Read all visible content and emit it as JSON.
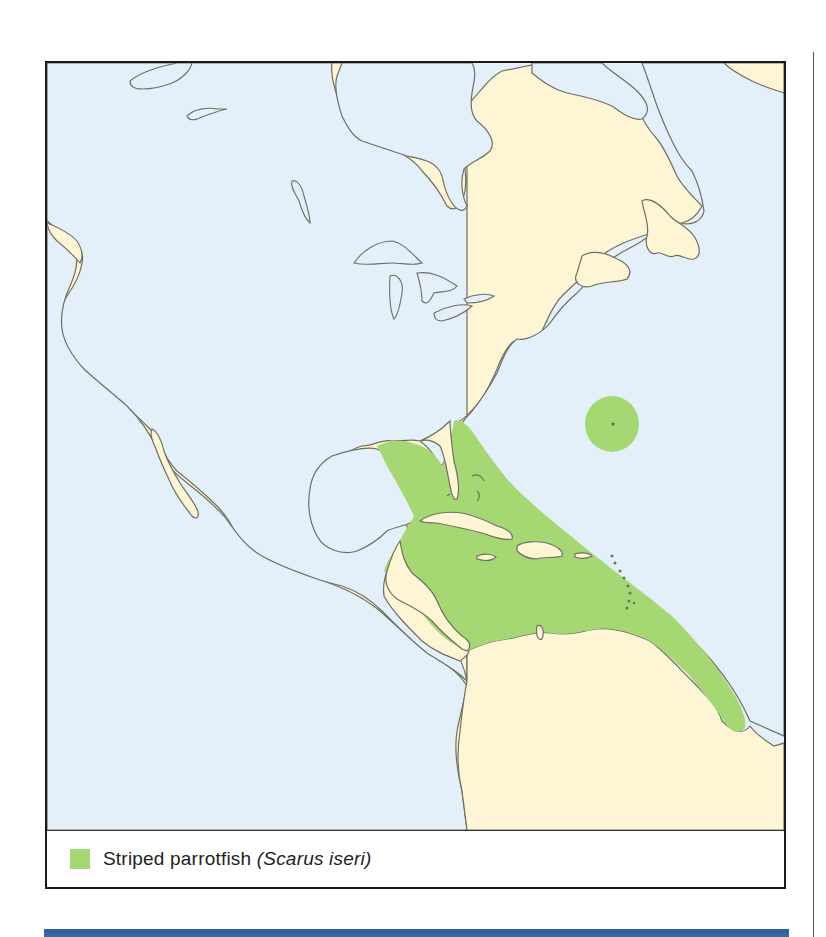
{
  "map": {
    "colors": {
      "land": "#fdf5d3",
      "water": "#e3f0fa",
      "range": "#a5d873",
      "coast": "#6f6e62",
      "frame": "#1a1a1a"
    },
    "regions_shown": [
      "North America",
      "Central America",
      "Caribbean",
      "Northern South America",
      "Gulf of Mexico",
      "Hudson Bay",
      "Great Lakes",
      "Atlantic Ocean",
      "Pacific Ocean",
      "Bermuda"
    ]
  },
  "legend": {
    "swatch_color": "#a5d873",
    "common_name": "Striped parrotfish",
    "scientific_name_open": "(",
    "scientific_name": "Scarus iseri",
    "scientific_name_close": ")"
  },
  "range": {
    "species": "Striped parrotfish (Scarus iseri)",
    "areas": [
      "Gulf of Mexico (eastern)",
      "Florida",
      "Bahamas",
      "Caribbean Sea",
      "Lesser Antilles",
      "Northern South America coast to Guianas",
      "Bermuda"
    ]
  },
  "accent_bar_color": "#2f5f9c"
}
